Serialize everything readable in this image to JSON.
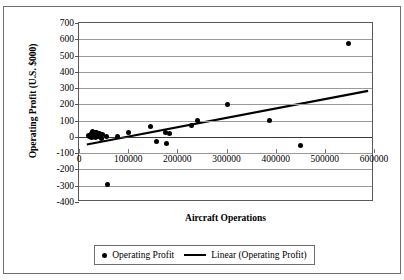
{
  "chart_data": {
    "type": "scatter",
    "title": "",
    "xlabel": "Aircraft Operations",
    "ylabel": "Operating Profit (U.S. $000)",
    "xlim": [
      0,
      600000
    ],
    "ylim": [
      -400,
      700
    ],
    "grid": true,
    "legend_position": "bottom",
    "x_ticks": [
      0,
      100000,
      200000,
      300000,
      400000,
      500000,
      600000
    ],
    "x_tick_labels": [
      "0",
      "100000",
      "200000",
      "300000",
      "400000",
      "500000",
      "600000"
    ],
    "y_ticks": [
      700,
      600,
      500,
      400,
      300,
      200,
      100,
      0,
      -100,
      -200,
      -300,
      -400
    ],
    "y_tick_labels": [
      "700",
      "600",
      "500",
      "400",
      "300",
      "200",
      "100",
      "0",
      "-100",
      "-200",
      "-300",
      "-400"
    ],
    "series": [
      {
        "name": "Operating Profit",
        "type": "scatter",
        "marker": "circle",
        "color": "#000000",
        "points": [
          {
            "x": 20000,
            "y": 10
          },
          {
            "x": 22000,
            "y": 0
          },
          {
            "x": 25000,
            "y": 20
          },
          {
            "x": 26000,
            "y": -5
          },
          {
            "x": 28000,
            "y": 35
          },
          {
            "x": 30000,
            "y": 5
          },
          {
            "x": 31000,
            "y": 15
          },
          {
            "x": 33000,
            "y": 25
          },
          {
            "x": 34000,
            "y": -2
          },
          {
            "x": 36000,
            "y": 30
          },
          {
            "x": 38000,
            "y": 8
          },
          {
            "x": 40000,
            "y": 0
          },
          {
            "x": 42000,
            "y": 18
          },
          {
            "x": 45000,
            "y": -8
          },
          {
            "x": 48000,
            "y": 12
          },
          {
            "x": 55000,
            "y": 5
          },
          {
            "x": 58000,
            "y": -290
          },
          {
            "x": 78000,
            "y": 0
          },
          {
            "x": 100000,
            "y": 25
          },
          {
            "x": 145000,
            "y": 62
          },
          {
            "x": 158000,
            "y": -28
          },
          {
            "x": 175000,
            "y": 30
          },
          {
            "x": 178000,
            "y": -40
          },
          {
            "x": 185000,
            "y": 22
          },
          {
            "x": 228000,
            "y": 72
          },
          {
            "x": 242000,
            "y": 98
          },
          {
            "x": 302000,
            "y": 200
          },
          {
            "x": 388000,
            "y": 100
          },
          {
            "x": 450000,
            "y": -55
          },
          {
            "x": 548000,
            "y": 573
          }
        ]
      },
      {
        "name": "Linear (Operating Profit)",
        "type": "line",
        "color": "#000000",
        "endpoints": [
          {
            "x": 16000,
            "y": -55
          },
          {
            "x": 592000,
            "y": 278
          }
        ]
      }
    ],
    "legend": [
      {
        "label": "Operating Profit",
        "marker": "dot"
      },
      {
        "label": "Linear (Operating Profit)",
        "marker": "line"
      }
    ]
  }
}
